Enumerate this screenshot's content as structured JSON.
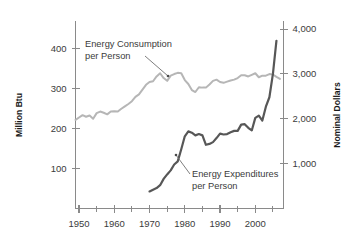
{
  "chart_data": {
    "type": "line",
    "title": "",
    "xlabel": "",
    "ylabel": "Million Btu",
    "y2label": "Nominal Dollars",
    "grid": false,
    "legend_position": "inline-annotations",
    "xlim": [
      1949,
      2008
    ],
    "ylim": [
      0,
      470
    ],
    "y2lim": [
      0,
      4180
    ],
    "x_ticks": [
      1950,
      1960,
      1970,
      1980,
      1990,
      2000
    ],
    "x_tick_labels": [
      "1950",
      "1960",
      "1970",
      "1980",
      "1990",
      "2000"
    ],
    "x_minor_ticks": [
      1955,
      1965,
      1975,
      1985,
      1995,
      2005
    ],
    "y_ticks": [
      100,
      200,
      300,
      400
    ],
    "y_tick_labels": [
      "100",
      "200",
      "300",
      "400"
    ],
    "y2_ticks": [
      1000,
      2000,
      3000,
      4000
    ],
    "y2_tick_labels": [
      "1,000",
      "2,000",
      "3,000",
      "4,000"
    ],
    "series": [
      {
        "name": "Energy Consumption per Person",
        "axis": "left",
        "unit": "Million Btu",
        "color": "#b6b6b6",
        "stroke_width": 2.0,
        "x": [
          1949,
          1950,
          1951,
          1952,
          1953,
          1954,
          1955,
          1956,
          1957,
          1958,
          1959,
          1960,
          1961,
          1962,
          1963,
          1964,
          1965,
          1966,
          1967,
          1968,
          1969,
          1970,
          1971,
          1972,
          1973,
          1974,
          1975,
          1976,
          1977,
          1978,
          1979,
          1980,
          1981,
          1982,
          1983,
          1984,
          1985,
          1986,
          1987,
          1988,
          1989,
          1990,
          1991,
          1992,
          1993,
          1994,
          1995,
          1996,
          1997,
          1998,
          1999,
          2000,
          2001,
          2002,
          2003,
          2004,
          2005,
          2006,
          2007
        ],
        "values": [
          222,
          228,
          234,
          230,
          233,
          225,
          239,
          243,
          240,
          236,
          243,
          244,
          243,
          250,
          256,
          262,
          269,
          280,
          286,
          298,
          310,
          317,
          319,
          331,
          339,
          327,
          320,
          333,
          337,
          340,
          339,
          322,
          312,
          297,
          292,
          304,
          303,
          303,
          311,
          320,
          323,
          317,
          315,
          318,
          321,
          323,
          327,
          334,
          334,
          331,
          335,
          339,
          329,
          333,
          333,
          337,
          336,
          330,
          325
        ]
      },
      {
        "name": "Energy Expenditures per Person",
        "axis": "right",
        "unit": "Nominal Dollars",
        "color": "#575757",
        "stroke_width": 2.2,
        "x": [
          1970,
          1971,
          1972,
          1973,
          1974,
          1975,
          1976,
          1977,
          1978,
          1979,
          1980,
          1981,
          1982,
          1983,
          1984,
          1985,
          1986,
          1987,
          1988,
          1989,
          1990,
          1991,
          1992,
          1993,
          1994,
          1995,
          1996,
          1997,
          1998,
          1999,
          2000,
          2001,
          2002,
          2003,
          2004,
          2005,
          2006
        ],
        "values": [
          380,
          420,
          455,
          520,
          660,
          760,
          850,
          980,
          1050,
          1320,
          1610,
          1720,
          1690,
          1630,
          1660,
          1630,
          1420,
          1440,
          1480,
          1570,
          1670,
          1650,
          1660,
          1700,
          1730,
          1730,
          1870,
          1880,
          1800,
          1740,
          2020,
          2070,
          1960,
          2270,
          2480,
          3000,
          3740
        ]
      }
    ],
    "annotations": [
      {
        "name": "consumption-label",
        "lines": [
          "Energy Consumption",
          "per Person"
        ],
        "text_x": 85,
        "text_y": 47,
        "leader_from_x": 145,
        "leader_from_y": 56,
        "leader_to_x": 168,
        "leader_to_y": 76
      },
      {
        "name": "expenditures-label",
        "lines": [
          "Energy Expenditures",
          "per Person"
        ],
        "text_x": 192,
        "text_y": 177,
        "leader_from_x": 190,
        "leader_from_y": 174,
        "leader_to_x": 176,
        "leader_to_y": 155
      }
    ]
  },
  "axes": {
    "left_title": "Million Btu",
    "right_title": "Nominal Dollars"
  }
}
